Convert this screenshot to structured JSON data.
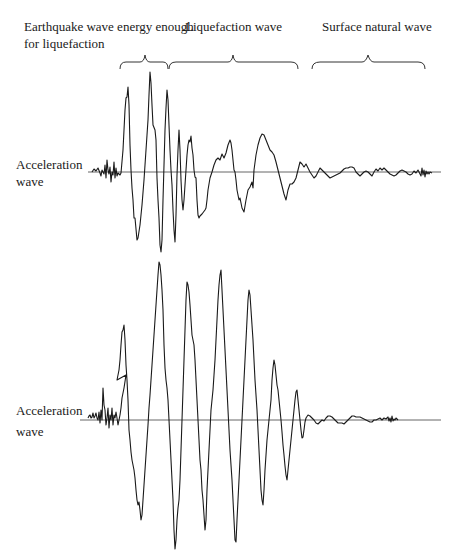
{
  "diagram": {
    "header_labels": [
      {
        "text": "Earthquake wave energy enough",
        "line2": "for liquefaction"
      },
      {
        "text": "Liquefaction wave"
      },
      {
        "text": "Surface natural wave"
      }
    ],
    "panels": [
      {
        "name": "upper",
        "axis_label_line1": "Acceleration",
        "axis_label_line2": "wave"
      },
      {
        "name": "lower",
        "axis_label_line1": "Acceleration",
        "axis_label_line2": "wave"
      }
    ],
    "colors": {
      "stroke": "#1a1a1a",
      "axis": "#555555",
      "background": "#ffffff"
    }
  }
}
